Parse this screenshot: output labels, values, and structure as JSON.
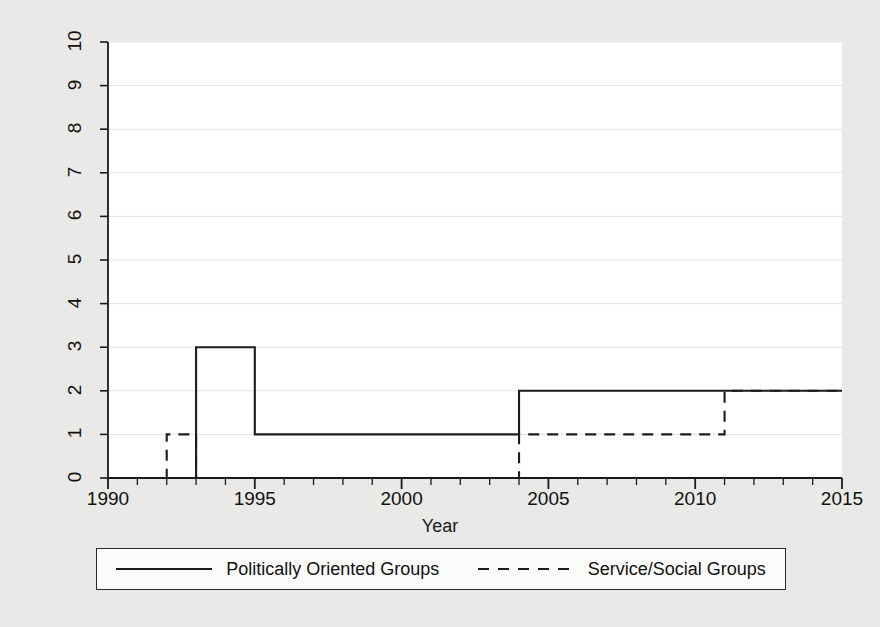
{
  "chart_data": {
    "type": "line",
    "subtype": "step-post",
    "title": "",
    "xlabel": "Year",
    "ylabel": "Number of Groups",
    "xlim": [
      1990,
      2015
    ],
    "ylim": [
      0,
      10
    ],
    "grid": true,
    "grid_axis": "y",
    "legend_position": "bottom",
    "x_ticks": [
      1990,
      1995,
      2000,
      2005,
      2010,
      2015
    ],
    "x_minor_tick_interval": 1,
    "y_ticks": [
      0,
      1,
      2,
      3,
      4,
      5,
      6,
      7,
      8,
      9,
      10
    ],
    "series": [
      {
        "name": "Politically Oriented Groups",
        "style": "solid",
        "color": "#1c1c1c",
        "x": [
          1990,
          1993,
          1995,
          2004,
          2015
        ],
        "values": [
          0,
          3,
          1,
          2,
          2
        ],
        "steps": [
          {
            "from_year": 1990,
            "to_year": 1993,
            "value": 0
          },
          {
            "from_year": 1993,
            "to_year": 1995,
            "value": 3
          },
          {
            "from_year": 1995,
            "to_year": 2004,
            "value": 1
          },
          {
            "from_year": 2004,
            "to_year": 2015,
            "value": 2
          }
        ]
      },
      {
        "name": "Service/Social Groups",
        "style": "dashed",
        "color": "#1c1c1c",
        "x": [
          1990,
          1992,
          1993,
          2004,
          2011,
          2015
        ],
        "values": [
          0,
          1,
          0,
          1,
          2,
          2
        ],
        "steps": [
          {
            "from_year": 1990,
            "to_year": 1992,
            "value": 0
          },
          {
            "from_year": 1992,
            "to_year": 1993,
            "value": 1
          },
          {
            "from_year": 1993,
            "to_year": 2004,
            "value": 0
          },
          {
            "from_year": 2004,
            "to_year": 2011,
            "value": 1
          },
          {
            "from_year": 2011,
            "to_year": 2015,
            "value": 2
          }
        ]
      }
    ]
  },
  "axes": {
    "y_title": "Number of Groups",
    "x_title": "Year",
    "y_tick_labels": [
      "0",
      "1",
      "2",
      "3",
      "4",
      "5",
      "6",
      "7",
      "8",
      "9",
      "10"
    ],
    "x_tick_labels": [
      "1990",
      "1995",
      "2000",
      "2005",
      "2010",
      "2015"
    ]
  },
  "legend": {
    "entries": [
      {
        "label": "Politically Oriented Groups",
        "style": "solid"
      },
      {
        "label": "Service/Social Groups",
        "style": "dashed"
      }
    ]
  },
  "colors": {
    "figure_background": "#e9e9e7",
    "plot_background": "#ffffff",
    "line": "#1c1c1c",
    "grid": "#e3e3e3",
    "axis": "#1a1a1a"
  }
}
